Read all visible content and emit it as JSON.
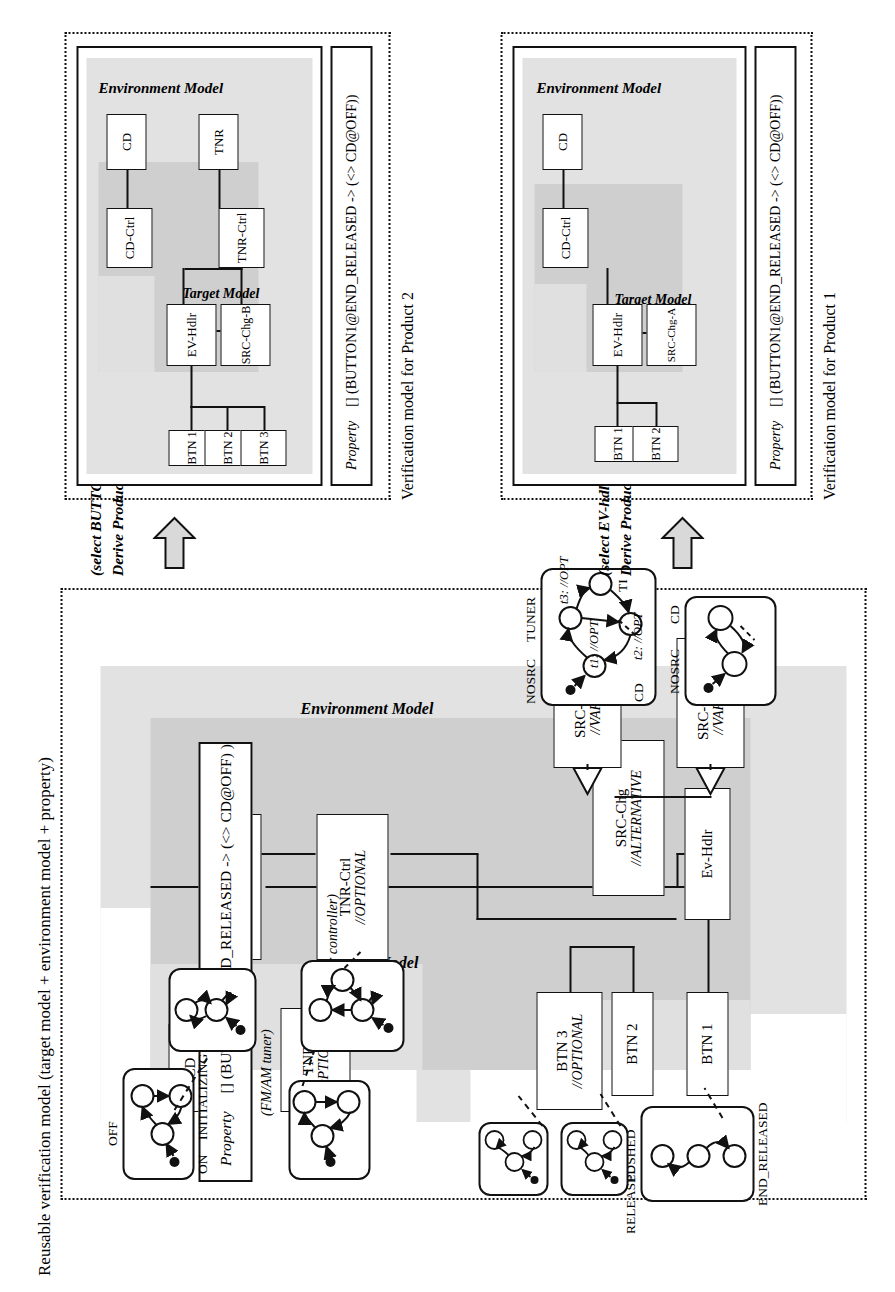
{
  "figure": {
    "main_title": "Reusable verification model (target model + environment model + property)",
    "caption_product1": "Verification model for Product 1",
    "caption_product2": "Verification model for Product 2"
  },
  "colors": {
    "target_model_fill": "#c9c9c9",
    "environment_model_fill": "#e0e0e0",
    "border": "#111111",
    "page_bg": "#ffffff"
  },
  "main_model": {
    "region_labels": {
      "target_model": "Target Model",
      "environment_model": "Environment Model"
    },
    "property": {
      "keyword": "Property",
      "formula": "[] (BUTTON1@END_RELEASED -> (<> CD@OFF) )"
    },
    "components": [
      {
        "id": "btn1",
        "name": "BTN 1",
        "stereotype": ""
      },
      {
        "id": "btn2",
        "name": "BTN 2",
        "stereotype": ""
      },
      {
        "id": "btn3",
        "name": "BTN 3",
        "stereotype": "//OPTIONAL"
      },
      {
        "id": "evhdlr",
        "name": "Ev-Hdlr",
        "stereotype": ""
      },
      {
        "id": "srcchg",
        "name": "SRC-Chg",
        "stereotype": "//ALTERNATIVE"
      },
      {
        "id": "srcchga",
        "name": "SRC-Chg-A",
        "stereotype": "//VARIANT"
      },
      {
        "id": "srcchgb",
        "name": "SRC-chg-B",
        "stereotype": "//VARIANT"
      },
      {
        "id": "cdctrl",
        "name": "CD-Ctrl",
        "stereotype": ""
      },
      {
        "id": "tnrctrl",
        "name": "TNR-Ctrl",
        "stereotype": "//OPTIONAL"
      },
      {
        "id": "cd",
        "name": "CD",
        "stereotype": ""
      },
      {
        "id": "tnr",
        "name": "TNR",
        "stereotype": "//OPTIONAL"
      }
    ],
    "annotations": [
      {
        "id": "tuner_controller_note",
        "text": "(tuner controller)"
      },
      {
        "id": "fm_am_tuner_note",
        "text": "(FM/AM tuner)"
      }
    ],
    "state_machines": {
      "button": {
        "id": "button-statechart",
        "states": [
          "RELEASED",
          "PUSHED",
          "END_RELEASED"
        ]
      },
      "cd": {
        "id": "cd-statechart",
        "states": [
          "OFF",
          "ON",
          "INITIALIZING"
        ]
      },
      "srcchg_a": {
        "id": "srcchg-a-statechart",
        "states": [
          "NOSRC",
          "CD"
        ]
      },
      "srcchg_b": {
        "id": "srcchg-b-statechart",
        "states": [
          "NOSRC",
          "TUNER",
          "CD",
          "TI"
        ],
        "transitions": [
          "t1: //OPT",
          "t2: //OPT",
          "t3: //OPT"
        ]
      }
    }
  },
  "derive_product1": {
    "title": "Derive Product 1 (CD only)",
    "subtitle": "(select EV-hdlr-A)"
  },
  "derive_product2": {
    "title": "Derive Product 2 (CD and TUNER)",
    "subtitle": "(select BUTTON3, EV-hdlr-B, TUNER-Ctrl, TUNER)"
  },
  "product1": {
    "region_labels": {
      "target_model": "Target Model",
      "environment_model": "Environment Model"
    },
    "property": {
      "keyword": "Property",
      "formula": "[] (BUTTON1@END_RELEASED -> (<> CD@OFF))"
    },
    "components": [
      {
        "id": "p1-btn1",
        "name": "BTN 1"
      },
      {
        "id": "p1-btn2",
        "name": "BTN 2"
      },
      {
        "id": "p1-evhdlr",
        "name": "EV-Hdlr"
      },
      {
        "id": "p1-srcchga",
        "name": "SRC-Chg-A"
      },
      {
        "id": "p1-cdctrl",
        "name": "CD-Ctrl"
      },
      {
        "id": "p1-cd",
        "name": "CD"
      }
    ]
  },
  "product2": {
    "region_labels": {
      "target_model": "Target Model",
      "environment_model": "Environment Model"
    },
    "property": {
      "keyword": "Property",
      "formula": "[] (BUTTON1@END_RELEASED -> (<> CD@OFF))"
    },
    "components": [
      {
        "id": "p2-btn1",
        "name": "BTN 1"
      },
      {
        "id": "p2-btn2",
        "name": "BTN 2"
      },
      {
        "id": "p2-btn3",
        "name": "BTN 3"
      },
      {
        "id": "p2-evhdlr",
        "name": "EV-Hdlr"
      },
      {
        "id": "p2-srcchgb",
        "name": "SRC-Chg-B"
      },
      {
        "id": "p2-cdctrl",
        "name": "CD-Ctrl"
      },
      {
        "id": "p2-tnrctrl",
        "name": "TNR-Ctrl"
      },
      {
        "id": "p2-cd",
        "name": "CD"
      },
      {
        "id": "p2-tnr",
        "name": "TNR"
      }
    ]
  }
}
